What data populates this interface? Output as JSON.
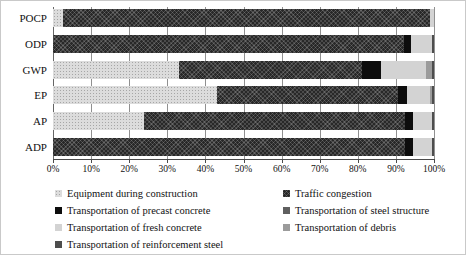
{
  "figure": {
    "kind": "stacked-horizontal-bar-chart",
    "background": "#ffffff",
    "border_color": "#c9c9c9"
  },
  "chart_data": {
    "type": "bar",
    "orientation": "horizontal",
    "stacked": true,
    "title": "",
    "xlabel": "",
    "ylabel": "",
    "xlim": [
      0,
      100
    ],
    "grid": true,
    "x_ticks": [
      "0%",
      "10%",
      "20%",
      "30%",
      "40%",
      "50%",
      "60%",
      "70%",
      "80%",
      "90%",
      "100%"
    ],
    "categories": [
      "POCP",
      "ODP",
      "GWP",
      "EP",
      "AP",
      "ADP"
    ],
    "series": [
      {
        "name": "Equipment during construction",
        "pattern": "dots",
        "color": "#dcdcdc",
        "values": [
          2.5,
          0,
          33,
          43,
          24,
          0
        ]
      },
      {
        "name": "Traffic congestion",
        "pattern": "crosshatch",
        "color": "#282828",
        "values": [
          96.5,
          92,
          48,
          47.5,
          68.5,
          92.5
        ]
      },
      {
        "name": "Transportation of precast concrete",
        "pattern": "solid",
        "color": "#0d0d0d",
        "values": [
          0,
          2,
          5,
          2.5,
          2,
          2
        ]
      },
      {
        "name": "Transportation of steel structure",
        "pattern": "solid",
        "color": "#5f5f5f",
        "values": [
          0,
          0,
          0,
          0,
          0,
          0
        ]
      },
      {
        "name": "Transportation of fresh concrete",
        "pattern": "solid",
        "color": "#d3d3d3",
        "values": [
          1,
          5.5,
          12,
          6,
          5,
          5
        ]
      },
      {
        "name": "Transportation of debris",
        "pattern": "solid",
        "color": "#9b9b9b",
        "values": [
          0,
          0,
          1.5,
          0.5,
          0,
          0
        ]
      },
      {
        "name": "Transportation of reinforcement steel",
        "pattern": "solid",
        "color": "#4d4d4d",
        "values": [
          0,
          0.5,
          0.5,
          0.5,
          0.5,
          0.5
        ]
      }
    ],
    "legend_position": "bottom",
    "legend_columns": [
      [
        0,
        2,
        4,
        6
      ],
      [
        1,
        3,
        5
      ]
    ]
  }
}
